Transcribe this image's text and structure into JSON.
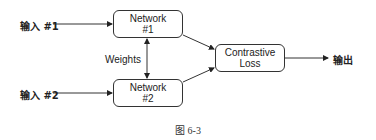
{
  "diagram": {
    "inputs": [
      {
        "label": "输入 #1"
      },
      {
        "label": "输入 #2"
      }
    ],
    "networks": [
      {
        "line1": "Network",
        "line2": "#1"
      },
      {
        "line1": "Network",
        "line2": "#2"
      }
    ],
    "shared_label": "Weights",
    "loss": {
      "line1": "Contrastive",
      "line2": "Loss"
    },
    "output": {
      "label": "输出"
    },
    "caption": "图 6-3",
    "colors": {
      "stroke": "#333333",
      "text": "#222222",
      "background": "#ffffff"
    }
  }
}
